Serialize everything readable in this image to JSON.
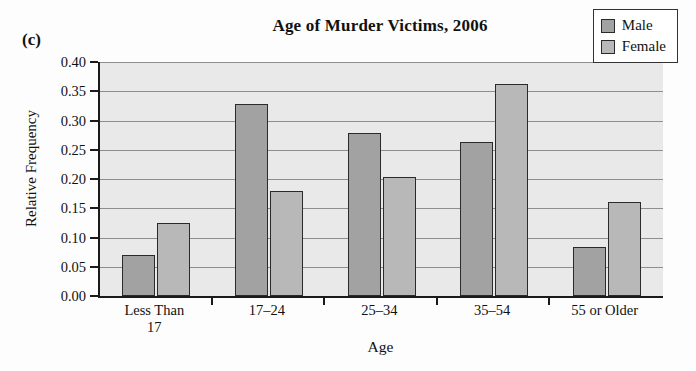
{
  "panel": {
    "letter": "(c)"
  },
  "chart_data": {
    "type": "bar",
    "title": "Age of Murder Victims, 2006",
    "xlabel": "Age",
    "ylabel": "Relative Frequency",
    "categories": [
      "Less Than 17",
      "17–24",
      "25–34",
      "35–54",
      "55 or Older"
    ],
    "category_lines": [
      [
        "Less Than",
        "17"
      ],
      [
        "17–24"
      ],
      [
        "25–34"
      ],
      [
        "35–54"
      ],
      [
        "55 or Older"
      ]
    ],
    "series": [
      {
        "name": "Male",
        "color": "#a2a2a2",
        "values": [
          0.07,
          0.328,
          0.278,
          0.264,
          0.083
        ]
      },
      {
        "name": "Female",
        "color": "#b8b8b8",
        "values": [
          0.125,
          0.18,
          0.203,
          0.362,
          0.16
        ]
      }
    ],
    "ylim": [
      0.0,
      0.4
    ],
    "ytick_step": 0.05,
    "ytick_labels": [
      "0.00",
      "0.05",
      "0.10",
      "0.15",
      "0.20",
      "0.25",
      "0.30",
      "0.35",
      "0.40"
    ],
    "ytick_values": [
      0.0,
      0.05,
      0.1,
      0.15,
      0.2,
      0.25,
      0.3,
      0.35,
      0.4
    ],
    "grid": true,
    "legend_position": "top-right",
    "plot_background": "#e9e9e9"
  }
}
